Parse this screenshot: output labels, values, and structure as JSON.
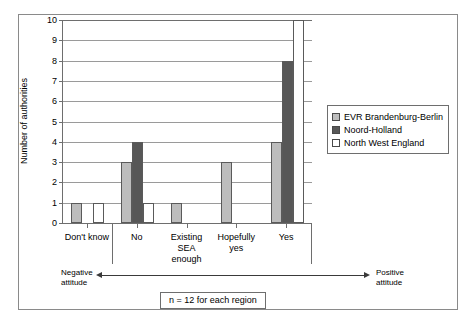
{
  "chart_data": {
    "type": "bar",
    "title": "",
    "xlabel": "",
    "ylabel": "Number of authorities",
    "ylim": [
      0,
      10
    ],
    "yticks": [
      0,
      1,
      2,
      3,
      4,
      5,
      6,
      7,
      8,
      9,
      10
    ],
    "ytick_labels": [
      "0",
      "1",
      "2",
      "3",
      "4",
      "5",
      "6",
      "7",
      "8",
      "9",
      "10"
    ],
    "grid": true,
    "legend_position": "right",
    "categories": [
      "Don't know",
      "No",
      "Existing\nSEA\nenough",
      "Hopefully\nyes",
      "Yes"
    ],
    "series": [
      {
        "name": "EVR Brandenburg-Berlin",
        "color": "#bdbdbd",
        "values": [
          1,
          3,
          1,
          3,
          4
        ]
      },
      {
        "name": "Noord-Holland",
        "color": "#575757",
        "values": [
          0,
          4,
          0,
          0,
          8
        ]
      },
      {
        "name": "North West England",
        "color": "#ffffff",
        "values": [
          1,
          1,
          0,
          0,
          10
        ]
      }
    ],
    "annotations": {
      "left_attitude": "Negative\nattitude",
      "right_attitude": "Positive\nattitude",
      "caption": "n = 12 for each region"
    }
  },
  "legend": {
    "items": [
      {
        "label": "EVR Brandenburg-Berlin"
      },
      {
        "label": "Noord-Holland"
      },
      {
        "label": "North West England"
      }
    ]
  }
}
